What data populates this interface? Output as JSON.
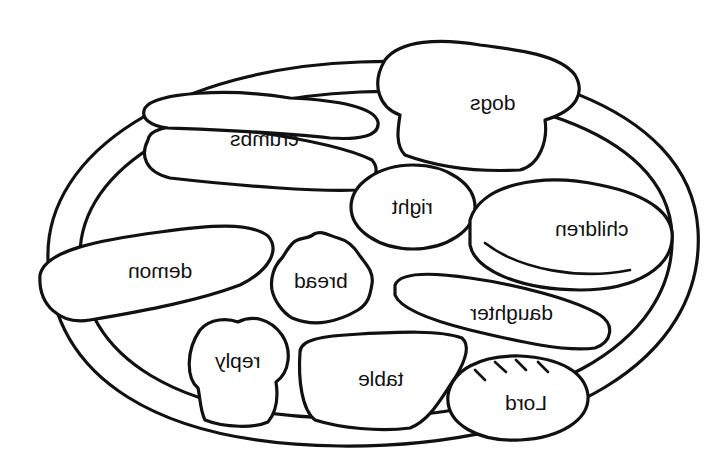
{
  "figure": {
    "text_mirrored": true,
    "stroke_color": "#111111",
    "background_color": "#ffffff"
  },
  "labels": {
    "dogs": "dogs",
    "crumbs": "crumbs",
    "right": "right",
    "children": "children",
    "demon": "demon",
    "bread": "bread",
    "daughter": "daughter",
    "reply": "reply",
    "table": "table",
    "lord": "Lord"
  }
}
